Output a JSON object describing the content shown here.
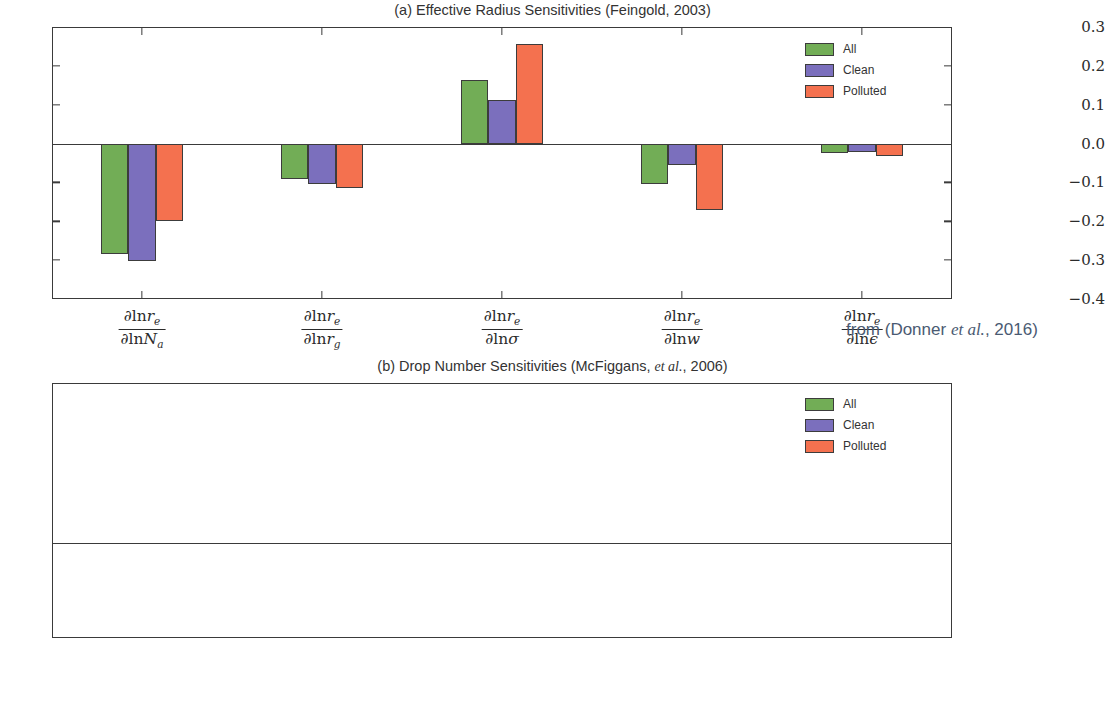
{
  "figure": {
    "annotation_prefix": "from (Donner ",
    "annotation_italic": "et al.",
    "annotation_suffix": ", 2016)"
  },
  "legend": {
    "items": [
      {
        "label": "All",
        "color": "#72ad56"
      },
      {
        "label": "Clean",
        "color": "#7b6fbd"
      },
      {
        "label": "Polluted",
        "color": "#f4714f"
      }
    ]
  },
  "panel_a": {
    "title_plain_1": "(a) Effective Radius Sensitivities (Feingold, 2003)",
    "yticks": [
      "0.3",
      "0.2",
      "0.1",
      "0.0",
      "−0.1",
      "−0.2",
      "−0.3",
      "−0.4"
    ],
    "xlabels": [
      {
        "num_lead": "∂ln",
        "num_var": "r",
        "num_sub": "e",
        "den_lead": "∂ln",
        "den_var": "N",
        "den_sub": "a"
      },
      {
        "num_lead": "∂ln",
        "num_var": "r",
        "num_sub": "e",
        "den_lead": "∂ln",
        "den_var": "r",
        "den_sub": "g"
      },
      {
        "num_lead": "∂ln",
        "num_var": "r",
        "num_sub": "e",
        "den_lead": "∂ln",
        "den_var": "σ",
        "den_sub": ""
      },
      {
        "num_lead": "∂ln",
        "num_var": "r",
        "num_sub": "e",
        "den_lead": "∂ln",
        "den_var": "w",
        "den_sub": ""
      },
      {
        "num_lead": "∂ln",
        "num_var": "r",
        "num_sub": "e",
        "den_lead": "∂ln",
        "den_var": "ϵ",
        "den_sub": ""
      }
    ]
  },
  "panel_b": {
    "title_plain_1": "(b) Drop Number Sensitivities (McFiggans, ",
    "title_italic": "et al.",
    "title_plain_2": ", 2006)",
    "yticks": [
      "1.0",
      "0.8",
      "0.6",
      "0.4",
      "0.2",
      "0.0",
      "−0.2",
      "−0.4",
      "−0.6"
    ],
    "xlabels": [
      {
        "num_lead": "∂ln",
        "num_var": "N",
        "num_sub": "d",
        "den_lead": "∂ln",
        "den_var": "N",
        "den_sub": "a"
      },
      {
        "num_lead": "∂ln",
        "num_var": "N",
        "num_sub": "d",
        "den_lead": "∂ln",
        "den_var": "r",
        "den_sub": "g"
      },
      {
        "num_lead": "∂ln",
        "num_var": "N",
        "num_sub": "d",
        "den_lead": "∂ln",
        "den_var": "σ",
        "den_sub": ""
      },
      {
        "num_lead": "∂ln",
        "num_var": "N",
        "num_sub": "d",
        "den_lead": "∂ln",
        "den_var": "w",
        "den_sub": ""
      },
      {
        "num_lead": "∂ln",
        "num_var": "N",
        "num_sub": "d",
        "den_lead": "∂ln",
        "den_var": "ϵ",
        "den_sub": ""
      }
    ]
  },
  "chart_data": [
    {
      "type": "bar",
      "id": "panel-a",
      "title": "(a) Effective Radius Sensitivities (Feingold, 2003)",
      "xlabel": "",
      "ylabel": "",
      "ylim": [
        -0.4,
        0.3
      ],
      "ytick_values": [
        0.3,
        0.2,
        0.1,
        0.0,
        -0.1,
        -0.2,
        -0.3,
        -0.4
      ],
      "grid": false,
      "legend_position": "upper right",
      "categories": [
        "dlnr_e/dlnN_a",
        "dlnr_e/dlnr_g",
        "dlnr_e/dlnsigma",
        "dlnr_e/dlnw",
        "dlnr_e/dlnepsilon"
      ],
      "series": [
        {
          "name": "All",
          "color": "#72ad56",
          "values": [
            -0.285,
            -0.09,
            0.163,
            -0.105,
            -0.025
          ]
        },
        {
          "name": "Clean",
          "color": "#7b6fbd",
          "values": [
            -0.303,
            -0.105,
            0.112,
            -0.055,
            -0.022
          ]
        },
        {
          "name": "Polluted",
          "color": "#f4714f",
          "values": [
            -0.2,
            -0.115,
            0.257,
            -0.17,
            -0.033
          ]
        }
      ]
    },
    {
      "type": "bar",
      "id": "panel-b",
      "title": "(b) Drop Number Sensitivities (McFiggans, et al., 2006)",
      "xlabel": "",
      "ylabel": "",
      "ylim": [
        -0.6,
        1.0
      ],
      "ytick_values": [
        1.0,
        0.8,
        0.6,
        0.4,
        0.2,
        0.0,
        -0.2,
        -0.4,
        -0.6
      ],
      "grid": false,
      "legend_position": "upper right",
      "categories": [
        "dlnN_d/dlnN_a",
        "dlnN_d/dlnr_g",
        "dlnN_d/dlnsigma",
        "dlnN_d/dlnw",
        "dlnN_d/dlnepsilon"
      ],
      "series": [
        {
          "name": "All",
          "color": "#72ad56",
          "values": [
            0.88,
            0.32,
            -0.39,
            0.28,
            0.11
          ]
        },
        {
          "name": "Clean",
          "color": "#7b6fbd",
          "values": [
            0.92,
            0.28,
            -0.33,
            0.18,
            0.09
          ]
        },
        {
          "name": "Polluted",
          "color": "#f4714f",
          "values": [
            0.73,
            0.39,
            -0.53,
            0.47,
            0.13
          ]
        }
      ]
    }
  ]
}
